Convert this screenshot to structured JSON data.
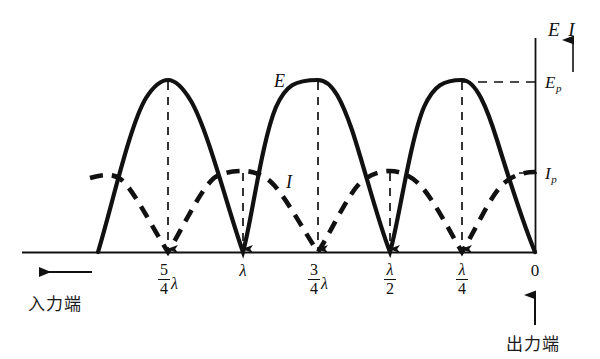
{
  "figure": {
    "title_label": "E I",
    "curve_labels": {
      "voltage": "E",
      "current": "I"
    },
    "axis_markers": {
      "ep": "E",
      "ep_sub": "p",
      "ip": "I",
      "ip_sub": "p"
    },
    "end_labels": {
      "input": "入力端",
      "output": "出力端",
      "input_arrow": "left-arrow",
      "output_arrow": "up-arrow"
    },
    "colors": {
      "ink": "#111111",
      "background": "#ffffff"
    }
  },
  "chart_data": {
    "type": "line",
    "title": "",
    "xlabel": "",
    "ylabel": "E I",
    "xlim": [
      0,
      1.375
    ],
    "ylim": [
      0,
      1.0
    ],
    "grid": false,
    "legend": "inline-curve-labels",
    "x_axis_direction": "right-to-left (0 at right)",
    "tick_labels": [
      "5/4 λ",
      "λ",
      "3/4 λ",
      "λ/2",
      "λ/4",
      "0"
    ],
    "tick_values": [
      1.25,
      1.0,
      0.75,
      0.5,
      0.25,
      0.0
    ],
    "tick_px": [
      168,
      243,
      318,
      390,
      462,
      535
    ],
    "baseline_y_px": 252,
    "axis_x_px": 535,
    "axis_top_px": 38,
    "ep_y_px": 82,
    "ip_y_px": 173,
    "series": [
      {
        "name": "E",
        "style": "solid",
        "peak_label": "E_p",
        "peak_value": 1.0,
        "maxima_at": [
          0.25,
          0.75,
          1.25
        ],
        "minima_at": [
          0.0,
          0.5,
          1.0
        ],
        "description": "Voltage standing wave, |sin(2πx/λ)| shape, zero at the output end"
      },
      {
        "name": "I",
        "style": "dashed",
        "peak_label": "I_p",
        "peak_value": 0.37,
        "maxima_at": [
          0.0,
          0.5,
          1.0
        ],
        "minima_at": [
          0.25,
          0.75,
          1.25
        ],
        "description": "Current standing wave, |cos(2πx/λ)| shape, maximum at the output end"
      }
    ],
    "annotations": [
      {
        "kind": "dashed-arrow-down",
        "at_x": 1.25,
        "from": "E peak",
        "to": "baseline"
      },
      {
        "kind": "dashed-arrow-down",
        "at_x": 1.0,
        "from": "I peak",
        "to": "baseline"
      },
      {
        "kind": "dashed-arrow-down",
        "at_x": 0.75,
        "from": "E peak",
        "to": "baseline"
      },
      {
        "kind": "dashed-arrow-down",
        "at_x": 0.5,
        "from": "I peak",
        "to": "baseline"
      },
      {
        "kind": "dashed-arrow-down",
        "at_x": 0.25,
        "from": "E peak",
        "to": "baseline"
      },
      {
        "kind": "dashed-level-line",
        "level": "E_p",
        "y_px": 82
      },
      {
        "kind": "tick",
        "level": "I_p",
        "y_px": 173
      }
    ]
  },
  "ticks": [
    {
      "id": "t-5-4-lambda",
      "num": "5",
      "den": "4",
      "lam": "λ",
      "x_px": 168,
      "form": "fraction-times-lambda"
    },
    {
      "id": "t-lambda",
      "plain": "λ",
      "x_px": 243,
      "form": "plain"
    },
    {
      "id": "t-3-4-lambda",
      "num": "3",
      "den": "4",
      "lam": "λ",
      "x_px": 318,
      "form": "fraction-times-lambda"
    },
    {
      "id": "t-lambda-2",
      "num": "λ",
      "den": "2",
      "x_px": 390,
      "form": "fraction"
    },
    {
      "id": "t-lambda-4",
      "num": "λ",
      "den": "4",
      "x_px": 462,
      "form": "fraction"
    },
    {
      "id": "t-zero",
      "plain": "0",
      "x_px": 535,
      "form": "plain-upright"
    }
  ]
}
